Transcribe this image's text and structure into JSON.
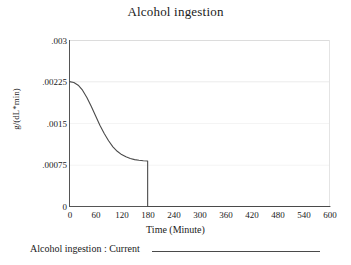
{
  "chart_data": {
    "type": "line",
    "title": "Alcohol ingestion",
    "xlabel": "Time (Minute)",
    "ylabel": "g/(dL*min)",
    "xlim": [
      0,
      600
    ],
    "ylim": [
      0,
      0.003
    ],
    "grid": true,
    "legend_position": "bottom",
    "xticks": [
      "0",
      "60",
      "120",
      "180",
      "240",
      "300",
      "360",
      "420",
      "480",
      "540",
      "600"
    ],
    "xtick_values": [
      0,
      60,
      120,
      180,
      240,
      300,
      360,
      420,
      480,
      540,
      600
    ],
    "yticks": [
      "0",
      ".00075",
      ".0015",
      ".00225",
      ".003"
    ],
    "ytick_values": [
      0,
      0.00075,
      0.0015,
      0.00225,
      0.003
    ],
    "series": [
      {
        "name": "Alcohol ingestion : Current",
        "color": "#4a4a4a",
        "x": [
          0,
          10,
          20,
          30,
          40,
          50,
          60,
          70,
          80,
          90,
          100,
          110,
          120,
          130,
          140,
          150,
          160,
          170,
          180,
          180.01,
          240,
          300,
          360,
          420,
          480,
          540,
          600
        ],
        "y": [
          0.00225,
          0.002235,
          0.002185,
          0.002095,
          0.001965,
          0.001805,
          0.001635,
          0.001465,
          0.001315,
          0.001185,
          0.001075,
          0.000995,
          0.000935,
          0.000895,
          0.000865,
          0.000845,
          0.000832,
          0.000824,
          0.00082,
          0,
          0,
          0,
          0,
          0,
          0,
          0,
          0
        ]
      }
    ],
    "annotations": []
  },
  "legend": {
    "label": "Alcohol ingestion : Current"
  }
}
